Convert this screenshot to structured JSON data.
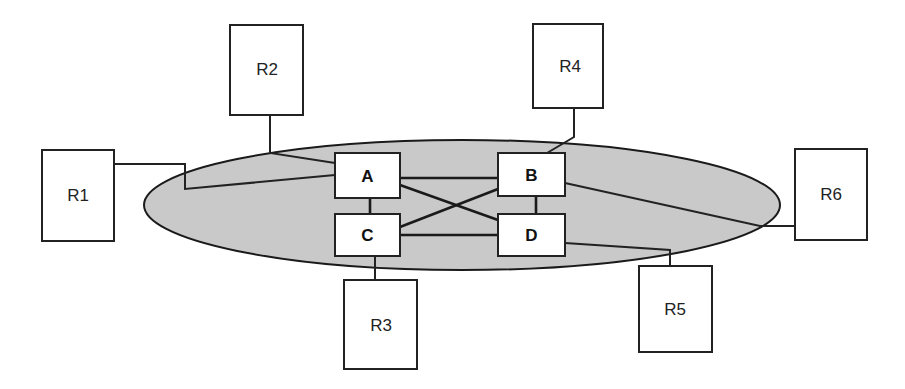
{
  "diagram": {
    "type": "network-topology",
    "colors": {
      "background": "#ffffff",
      "cloud_fill": "#c9c9c9",
      "stroke": "#1a1a1a",
      "box_fill": "#ffffff"
    },
    "core_nodes": [
      {
        "id": "A",
        "label": "A"
      },
      {
        "id": "B",
        "label": "B"
      },
      {
        "id": "C",
        "label": "C"
      },
      {
        "id": "D",
        "label": "D"
      }
    ],
    "edge_nodes": [
      {
        "id": "R1",
        "label": "R1",
        "attached_to": "A"
      },
      {
        "id": "R2",
        "label": "R2",
        "attached_to": "A"
      },
      {
        "id": "R3",
        "label": "R3",
        "attached_to": "C"
      },
      {
        "id": "R4",
        "label": "R4",
        "attached_to": "B"
      },
      {
        "id": "R5",
        "label": "R5",
        "attached_to": "D"
      },
      {
        "id": "R6",
        "label": "R6",
        "attached_to": "B"
      }
    ],
    "core_links": [
      [
        "A",
        "B"
      ],
      [
        "A",
        "C"
      ],
      [
        "A",
        "D"
      ],
      [
        "B",
        "C"
      ],
      [
        "B",
        "D"
      ],
      [
        "C",
        "D"
      ]
    ]
  }
}
